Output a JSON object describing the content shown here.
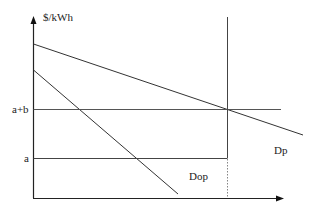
{
  "diagram": {
    "y_axis_label": "$/kWh",
    "price_levels": {
      "upper_label": "a+b",
      "lower_label": "a"
    },
    "curves": [
      {
        "name": "Dp",
        "label": "Dp"
      },
      {
        "name": "Dop",
        "label": "Dop"
      }
    ],
    "colors": {
      "line": "#333333",
      "axis": "#222222",
      "background": "#ffffff"
    }
  }
}
